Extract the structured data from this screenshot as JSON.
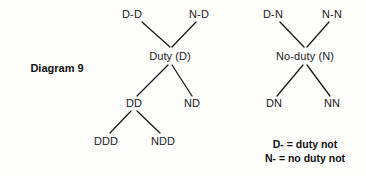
{
  "figure": {
    "caption": "Diagram 9",
    "caption_x": 57,
    "caption_y": 68
  },
  "left_tree": {
    "name": "duty-tree",
    "nodes": [
      {
        "id": "d-d",
        "label": "D-D",
        "x": 132,
        "y": 14
      },
      {
        "id": "n-d",
        "label": "N-D",
        "x": 199,
        "y": 14
      },
      {
        "id": "duty",
        "label": "Duty (D)",
        "x": 170,
        "y": 56
      },
      {
        "id": "dd",
        "label": "DD",
        "x": 134,
        "y": 103
      },
      {
        "id": "nd",
        "label": "ND",
        "x": 192,
        "y": 103
      },
      {
        "id": "ddd",
        "label": "DDD",
        "x": 106,
        "y": 141
      },
      {
        "id": "ndd",
        "label": "NDD",
        "x": 163,
        "y": 141
      }
    ],
    "edges": [
      {
        "from": "d-d",
        "to": "duty",
        "x1": 142,
        "y1": 22,
        "x2": 170,
        "y2": 47
      },
      {
        "from": "n-d",
        "to": "duty",
        "x1": 196,
        "y1": 22,
        "x2": 172,
        "y2": 47
      },
      {
        "from": "duty",
        "to": "dd",
        "x1": 168,
        "y1": 65,
        "x2": 137,
        "y2": 96
      },
      {
        "from": "duty",
        "to": "nd",
        "x1": 172,
        "y1": 65,
        "x2": 192,
        "y2": 96
      },
      {
        "from": "dd",
        "to": "ddd",
        "x1": 131,
        "y1": 111,
        "x2": 110,
        "y2": 133
      },
      {
        "from": "dd",
        "to": "ndd",
        "x1": 137,
        "y1": 111,
        "x2": 160,
        "y2": 133
      }
    ]
  },
  "right_tree": {
    "name": "no-duty-tree",
    "nodes": [
      {
        "id": "d-n",
        "label": "D-N",
        "x": 273,
        "y": 14
      },
      {
        "id": "n-n",
        "label": "N-N",
        "x": 332,
        "y": 14
      },
      {
        "id": "no-duty",
        "label": "No-duty (N)",
        "x": 305,
        "y": 56
      },
      {
        "id": "dn",
        "label": "DN",
        "x": 274,
        "y": 103
      },
      {
        "id": "nn",
        "label": "NN",
        "x": 332,
        "y": 103
      }
    ],
    "edges": [
      {
        "from": "d-n",
        "to": "no-duty",
        "x1": 280,
        "y1": 22,
        "x2": 304,
        "y2": 47
      },
      {
        "from": "n-n",
        "to": "no-duty",
        "x1": 329,
        "y1": 22,
        "x2": 307,
        "y2": 47
      },
      {
        "from": "no-duty",
        "to": "dn",
        "x1": 303,
        "y1": 65,
        "x2": 277,
        "y2": 96
      },
      {
        "from": "no-duty",
        "to": "nn",
        "x1": 307,
        "y1": 65,
        "x2": 330,
        "y2": 96
      }
    ]
  },
  "legend": {
    "lines": [
      {
        "id": "legend-d",
        "text": "D- = duty not",
        "x": 305,
        "y": 144
      },
      {
        "id": "legend-n",
        "text": "N- = no duty not",
        "x": 305,
        "y": 158
      }
    ]
  },
  "style": {
    "edge_color": "#1b1b1b",
    "edge_width": 1.3,
    "text_color": "#1b1b1b",
    "background": "#fdfdfc"
  }
}
